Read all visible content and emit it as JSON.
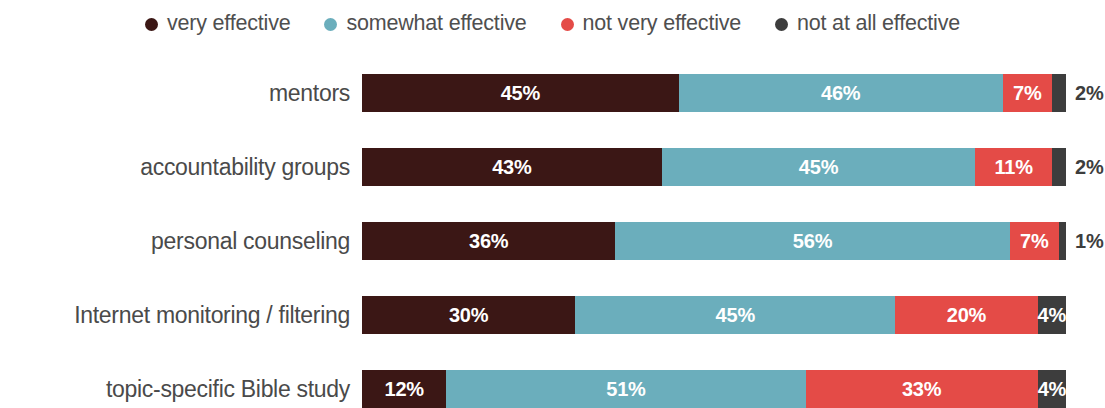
{
  "legend": {
    "items": [
      {
        "label": "very effective",
        "color": "#3B1715",
        "marker": "legend-dot-icon"
      },
      {
        "label": "somewhat effective",
        "color": "#6BAEBC",
        "marker": "legend-dot-icon"
      },
      {
        "label": "not very effective",
        "color": "#E44B47",
        "marker": "legend-dot-icon"
      },
      {
        "label": "not at all effective",
        "color": "#3D3D3D",
        "marker": "legend-dot-icon"
      }
    ]
  },
  "rows": [
    {
      "label": "mentors",
      "segments": [
        {
          "value": "45%",
          "pct": 45,
          "color": "#3B1715",
          "outside": false
        },
        {
          "value": "46%",
          "pct": 46,
          "color": "#6BAEBC",
          "outside": false
        },
        {
          "value": "7%",
          "pct": 7,
          "color": "#E44B47",
          "outside": false
        },
        {
          "value": "2%",
          "pct": 2,
          "color": "#3D3D3D",
          "outside": true
        }
      ]
    },
    {
      "label": "accountability groups",
      "segments": [
        {
          "value": "43%",
          "pct": 43,
          "color": "#3B1715",
          "outside": false
        },
        {
          "value": "45%",
          "pct": 45,
          "color": "#6BAEBC",
          "outside": false
        },
        {
          "value": "11%",
          "pct": 11,
          "color": "#E44B47",
          "outside": false
        },
        {
          "value": "2%",
          "pct": 2,
          "color": "#3D3D3D",
          "outside": true
        }
      ]
    },
    {
      "label": "personal counseling",
      "segments": [
        {
          "value": "36%",
          "pct": 36,
          "color": "#3B1715",
          "outside": false
        },
        {
          "value": "56%",
          "pct": 56,
          "color": "#6BAEBC",
          "outside": false
        },
        {
          "value": "7%",
          "pct": 7,
          "color": "#E44B47",
          "outside": false
        },
        {
          "value": "1%",
          "pct": 1,
          "color": "#3D3D3D",
          "outside": true
        }
      ]
    },
    {
      "label": "Internet monitoring / filtering",
      "segments": [
        {
          "value": "30%",
          "pct": 30,
          "color": "#3B1715",
          "outside": false
        },
        {
          "value": "45%",
          "pct": 45,
          "color": "#6BAEBC",
          "outside": false
        },
        {
          "value": "20%",
          "pct": 20,
          "color": "#E44B47",
          "outside": false
        },
        {
          "value": "4%",
          "pct": 4,
          "color": "#3D3D3D",
          "outside": false
        }
      ]
    },
    {
      "label": "topic-specific Bible study",
      "segments": [
        {
          "value": "12%",
          "pct": 12,
          "color": "#3B1715",
          "outside": false
        },
        {
          "value": "51%",
          "pct": 51,
          "color": "#6BAEBC",
          "outside": false
        },
        {
          "value": "33%",
          "pct": 33,
          "color": "#E44B47",
          "outside": false
        },
        {
          "value": "4%",
          "pct": 4,
          "color": "#3D3D3D",
          "outside": false
        }
      ]
    }
  ],
  "chart_data": {
    "type": "bar",
    "orientation": "horizontal",
    "stacked": true,
    "normalized": "100%",
    "title": "",
    "subtitle": "",
    "xlabel": "",
    "ylabel": "",
    "xlim": [
      0,
      100
    ],
    "grid": false,
    "legend_position": "top-center",
    "categories": [
      "mentors",
      "accountability groups",
      "personal counseling",
      "Internet monitoring / filtering",
      "topic-specific Bible study"
    ],
    "series": [
      {
        "name": "very effective",
        "color": "#3B1715",
        "values": [
          45,
          43,
          36,
          30,
          12
        ]
      },
      {
        "name": "somewhat effective",
        "color": "#6BAEBC",
        "values": [
          46,
          45,
          56,
          45,
          51
        ]
      },
      {
        "name": "not very effective",
        "color": "#E44B47",
        "values": [
          7,
          11,
          7,
          20,
          33
        ]
      },
      {
        "name": "not at all effective",
        "color": "#3D3D3D",
        "values": [
          2,
          2,
          1,
          4,
          4
        ]
      }
    ],
    "data_labels": [
      [
        "45%",
        "46%",
        "7%",
        "2%"
      ],
      [
        "43%",
        "45%",
        "11%",
        "2%"
      ],
      [
        "36%",
        "56%",
        "7%",
        "1%"
      ],
      [
        "30%",
        "45%",
        "20%",
        "4%"
      ],
      [
        "12%",
        "51%",
        "33%",
        "4%"
      ]
    ]
  }
}
